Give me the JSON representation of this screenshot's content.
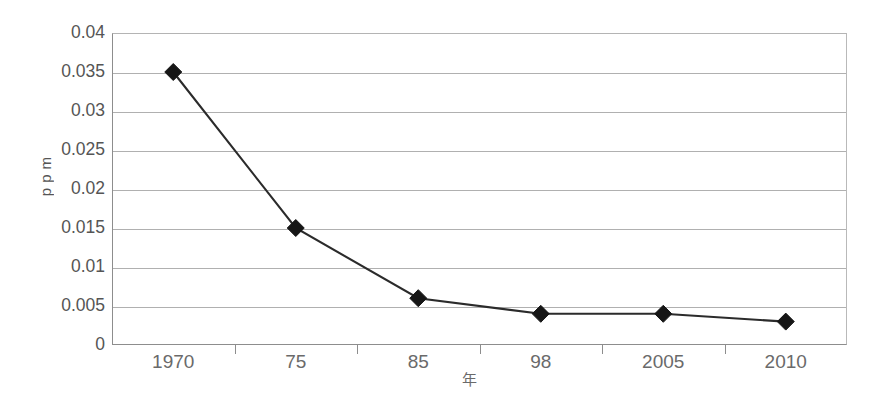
{
  "chart_data": {
    "type": "line",
    "title": "",
    "xlabel": "年",
    "ylabel": "ppm",
    "categories": [
      "1970",
      "75",
      "85",
      "98",
      "2005",
      "2010"
    ],
    "values": [
      0.035,
      0.015,
      0.006,
      0.004,
      0.004,
      0.003
    ],
    "series": [
      {
        "name": "ppm",
        "values": [
          0.035,
          0.015,
          0.006,
          0.004,
          0.004,
          0.003
        ]
      }
    ],
    "ylim": [
      0,
      0.04
    ],
    "y_ticks": [
      0,
      0.005,
      0.01,
      0.015,
      0.02,
      0.025,
      0.03,
      0.035,
      0.04
    ],
    "y_tick_labels": [
      "0",
      "0.005",
      "0.01",
      "0.015",
      "0.02",
      "0.025",
      "0.03",
      "0.035",
      "0.04"
    ],
    "grid": "horizontal",
    "legend": "none",
    "marker": "diamond",
    "colors": {
      "line": "#2b2b2b",
      "marker": "#161616",
      "gridline": "#b0b0b0",
      "axis": "#8d8d8d",
      "tick_label": "#555555",
      "background": "#ffffff"
    }
  }
}
